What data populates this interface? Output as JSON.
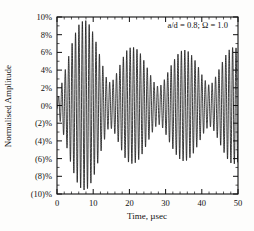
{
  "chart_data": {
    "type": "line",
    "title": "",
    "subtitle": "",
    "xlabel": "Time, µsec",
    "ylabel": "Normalised Amplitude",
    "xlim": [
      0,
      50
    ],
    "ylim": [
      -10,
      10
    ],
    "grid": false,
    "legend_position": "none",
    "annotations": [
      {
        "name": "parameter-annotation",
        "text": "a/d = 0.8; Ω = 1.0",
        "x": 34,
        "y": 9.0
      }
    ],
    "xticks": [
      0,
      10,
      20,
      30,
      40,
      50
    ],
    "xtick_labels": [
      "0",
      "10",
      "20",
      "30",
      "40",
      "50"
    ],
    "xminor_step": 2,
    "yticks": [
      10,
      8,
      6,
      4,
      2,
      0,
      -2,
      -4,
      -6,
      -8,
      -10
    ],
    "ytick_labels": [
      "10%",
      "8%",
      "6%",
      "4%",
      "2%",
      "0%",
      "(2)%",
      "(4)%",
      "(6)%",
      "(8)%",
      "(10)%"
    ],
    "yminor_step": 1,
    "series": [
      {
        "name": "normalised-amplitude",
        "color": "#1a1a1a",
        "description": "High-frequency oscillation with a beating amplitude envelope",
        "carrier_frequency_per_usec": 1.06,
        "envelope_beat_period_usec": 14.5,
        "envelope_peaks_usec": [
          8.0,
          21.0,
          35.0,
          48.0
        ],
        "envelope_nodes_usec": [
          14.5,
          28.0,
          42.0
        ],
        "envelope_peak_amplitudes": [
          9.6,
          6.6,
          6.3,
          6.6
        ],
        "envelope_node_amplitudes": [
          2.6,
          2.1,
          2.3
        ],
        "x": [
          0,
          1,
          2,
          3,
          4,
          5,
          6,
          7,
          8,
          9,
          10,
          11,
          12,
          13,
          14,
          15,
          16,
          17,
          18,
          19,
          20,
          21,
          22,
          23,
          24,
          25,
          26,
          27,
          28,
          29,
          30,
          31,
          32,
          33,
          34,
          35,
          36,
          37,
          38,
          39,
          40,
          41,
          42,
          43,
          44,
          45,
          46,
          47,
          48,
          49,
          50
        ],
        "envelope": [
          0.4,
          2.0,
          3.6,
          5.2,
          6.8,
          8.1,
          9.1,
          9.5,
          9.6,
          9.1,
          8.2,
          6.9,
          5.4,
          4.0,
          2.7,
          2.6,
          3.2,
          4.2,
          5.2,
          6.1,
          6.5,
          6.6,
          6.4,
          5.9,
          5.1,
          4.2,
          3.3,
          2.5,
          2.1,
          2.4,
          3.2,
          4.1,
          4.9,
          5.6,
          6.1,
          6.3,
          6.2,
          5.8,
          5.2,
          4.4,
          3.5,
          2.8,
          2.3,
          2.6,
          3.4,
          4.3,
          5.2,
          6.0,
          6.5,
          6.6,
          6.4
        ]
      }
    ]
  },
  "axes": {
    "frame_color": "#101010"
  }
}
